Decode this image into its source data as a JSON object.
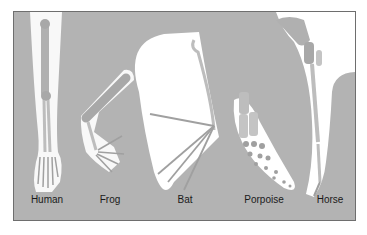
{
  "figure": {
    "background_color": "#b3b3b3",
    "highlight_color": "#ffffff",
    "bone_color": "#c9c9c9",
    "labels": [
      {
        "id": "human",
        "text": "Human",
        "x": 47
      },
      {
        "id": "frog",
        "text": "Frog",
        "x": 110
      },
      {
        "id": "bat",
        "text": "Bat",
        "x": 185
      },
      {
        "id": "porpoise",
        "text": "Porpoise",
        "x": 264
      },
      {
        "id": "horse",
        "text": "Horse",
        "x": 330
      }
    ]
  }
}
